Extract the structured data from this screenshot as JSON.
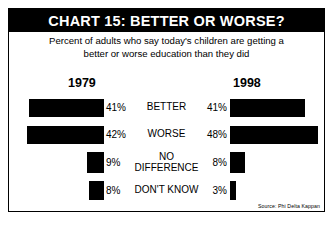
{
  "chart_data": {
    "type": "bar",
    "title": "CHART 15: BETTER OR WORSE?",
    "subtitle_line1": "Percent of adults who say today's children are getting a",
    "subtitle_line2": "better or worse education than they did",
    "xlabel": "",
    "ylabel": "",
    "xlim": [
      0,
      50
    ],
    "grid": false,
    "orientation": "horizontal-diverging",
    "legend_position": "top",
    "categories": [
      "BETTER",
      "WORSE",
      "NO DIFFERENCE",
      "DON'T KNOW"
    ],
    "series": [
      {
        "name": "1979",
        "values": [
          41,
          42,
          9,
          8
        ],
        "side": "left"
      },
      {
        "name": "1998",
        "values": [
          41,
          48,
          8,
          3
        ],
        "side": "right"
      }
    ],
    "value_labels": {
      "1979": [
        "41%",
        "42%",
        "9%",
        "8%"
      ],
      "1998": [
        "41%",
        "48%",
        "8%",
        "3%"
      ]
    },
    "source": "Source: Phi Delta Kappan",
    "bar_color": "#000000",
    "background_color": "#FFFFFF"
  },
  "rows": [
    {
      "label_line1": "BETTER",
      "label_line2": "",
      "left_value": "41%",
      "right_value": "41%",
      "left_pct": 41,
      "right_pct": 41
    },
    {
      "label_line1": "WORSE",
      "label_line2": "",
      "left_value": "42%",
      "right_value": "48%",
      "left_pct": 42,
      "right_pct": 48
    },
    {
      "label_line1": "NO",
      "label_line2": "DIFFERENCE",
      "left_value": "9%",
      "right_value": "8%",
      "left_pct": 9,
      "right_pct": 8
    },
    {
      "label_line1": "DON'T KNOW",
      "label_line2": "",
      "left_value": "8%",
      "right_value": "3%",
      "left_pct": 8,
      "right_pct": 3
    }
  ],
  "years": {
    "left": "1979",
    "right": "1998"
  },
  "footer": {
    "source": "Source: Phi Delta Kappan"
  }
}
